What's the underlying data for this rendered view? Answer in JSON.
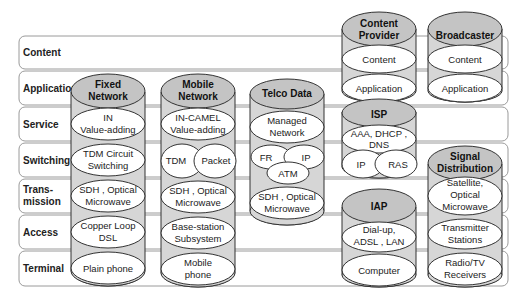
{
  "layers": [
    {
      "label": "Content"
    },
    {
      "label": "Application"
    },
    {
      "label": "Service"
    },
    {
      "label": "Switching"
    },
    {
      "label": "Trans-",
      "label2": "mission"
    },
    {
      "label": "Access"
    },
    {
      "label": "Terminal"
    }
  ],
  "stacks": {
    "fixed": {
      "title1": "Fixed",
      "title2": "Network",
      "service": {
        "l1": "IN",
        "l2": "Value-adding"
      },
      "switching": {
        "l1": "TDM Circuit",
        "l2": "Switching"
      },
      "transmission": {
        "l1": "SDH , Optical",
        "l2": "Microwave"
      },
      "access": {
        "l1": "Copper Loop",
        "l2": "DSL"
      },
      "terminal": {
        "l1": "Plain phone"
      }
    },
    "mobile": {
      "title1": "Mobile",
      "title2": "Network",
      "service": {
        "l1": "IN-CAMEL",
        "l2": "Value-adding"
      },
      "switching": {
        "a": "TDM",
        "b": "Packet"
      },
      "transmission": {
        "l1": "SDH , Optical",
        "l2": "Microwave"
      },
      "access": {
        "l1": "Base-station",
        "l2": "Subsystem"
      },
      "terminal": {
        "l1": "Mobile",
        "l2": "phone"
      }
    },
    "telco": {
      "title1": "Telco Data",
      "service": {
        "l1": "Managed",
        "l2": "Network"
      },
      "switching": {
        "a": "FR",
        "b": "IP",
        "c": "ATM"
      },
      "transmission": {
        "l1": "SDH , Optical",
        "l2": "Microwave"
      }
    },
    "content_provider": {
      "title1": "Content",
      "title2": "Provider",
      "content": {
        "l1": "Content"
      },
      "application": {
        "l1": "Application"
      }
    },
    "isp": {
      "title1": "ISP",
      "service": {
        "l1": "AAA, DHCP ,",
        "l2": "DNS"
      },
      "switching": {
        "a": "IP",
        "b": "RAS"
      }
    },
    "iap": {
      "title1": "IAP",
      "access": {
        "l1": "Dial-up,",
        "l2": "ADSL , LAN"
      },
      "terminal": {
        "l1": "Computer"
      }
    },
    "broadcaster": {
      "title1": "Broadcaster",
      "content": {
        "l1": "Content"
      },
      "application": {
        "l1": "Application"
      }
    },
    "signal": {
      "title1": "Signal",
      "title2": "Distribution",
      "transmission": {
        "l1": "Satellite,",
        "l2": "Optical",
        "l3": "Microwave"
      },
      "access": {
        "l1": "Transmitter",
        "l2": "Stations"
      },
      "terminal": {
        "l1": "Radio/TV",
        "l2": "Receivers"
      }
    }
  }
}
